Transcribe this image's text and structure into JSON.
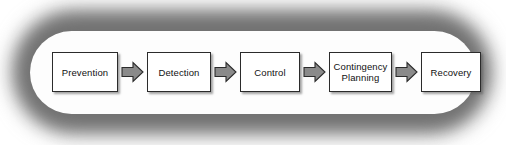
{
  "diagram": {
    "type": "linear-process-flow",
    "container": {
      "shape": "rounded-rectangle",
      "fill_color": "#fdfdfd",
      "halo_color": "#7b7b7b"
    },
    "connector": {
      "kind": "block-arrow",
      "direction": "right",
      "fill_color": "#8a8a8a",
      "stroke_color": "#2b2b2b",
      "icon": "right-block-arrow-icon"
    },
    "node_style": {
      "fill_color": "#ffffff",
      "border_color": "#2b2b2b",
      "shadow_color": "#5a5a5a"
    },
    "steps": [
      {
        "index": 1,
        "label": "Prevention"
      },
      {
        "index": 2,
        "label": "Detection"
      },
      {
        "index": 3,
        "label": "Control"
      },
      {
        "index": 4,
        "label": "Contingency\nPlanning"
      },
      {
        "index": 5,
        "label": "Recovery"
      }
    ]
  }
}
